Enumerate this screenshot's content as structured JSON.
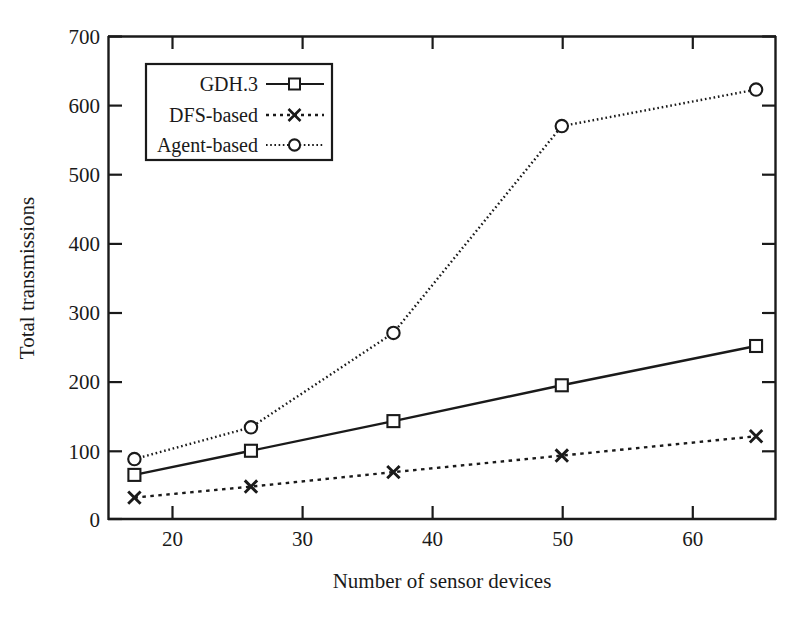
{
  "chart_data": {
    "type": "line",
    "title": "",
    "xlabel": "Number of sensor devices",
    "ylabel": "Total transmissions",
    "x": [
      16,
      25,
      36,
      49,
      64
    ],
    "xlim": [
      14,
      65.5
    ],
    "ylim": [
      0,
      700
    ],
    "xticks": [
      20,
      30,
      40,
      50,
      60
    ],
    "yticks": [
      0,
      100,
      200,
      300,
      400,
      500,
      600,
      700
    ],
    "grid": false,
    "legend_position": "upper-left-inside",
    "series": [
      {
        "name": "GDH.3",
        "values": [
          64,
          99,
          142,
          194,
          251
        ],
        "marker": "square",
        "line_style": "solid",
        "color": "#1a1a1a"
      },
      {
        "name": "DFS-based",
        "values": [
          31,
          47,
          68,
          92,
          120
        ],
        "marker": "x",
        "line_style": "dashed",
        "color": "#1a1a1a"
      },
      {
        "name": "Agent-based",
        "values": [
          87,
          133,
          270,
          570,
          623
        ],
        "marker": "circle",
        "line_style": "dotted",
        "color": "#1a1a1a"
      }
    ]
  },
  "axes": {
    "y_tick_labels": [
      "0",
      "100",
      "200",
      "300",
      "400",
      "500",
      "600",
      "700"
    ],
    "x_tick_labels": [
      "20",
      "30",
      "40",
      "50",
      "60"
    ],
    "x_title": "Number of sensor devices",
    "y_title": "Total transmissions"
  },
  "legend": {
    "items": [
      {
        "label": "GDH.3"
      },
      {
        "label": "DFS-based"
      },
      {
        "label": "Agent-based"
      }
    ]
  },
  "colors": {
    "ink": "#1a1a1a",
    "background": "#ffffff"
  }
}
